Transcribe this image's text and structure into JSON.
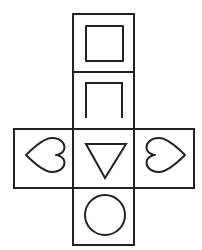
{
  "diagram": {
    "type": "cube-net",
    "stroke_color": "#222222",
    "background": "#ffffff",
    "faces": [
      {
        "position": "top",
        "symbol": "square"
      },
      {
        "position": "upper-middle",
        "symbol": "inverted-u"
      },
      {
        "position": "left",
        "symbol": "heart-pointing-left"
      },
      {
        "position": "center",
        "symbol": "downward-triangle"
      },
      {
        "position": "right",
        "symbol": "heart-pointing-right"
      },
      {
        "position": "bottom",
        "symbol": "circle"
      }
    ]
  }
}
